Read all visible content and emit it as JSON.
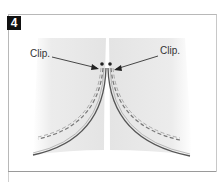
{
  "step": {
    "number": "4"
  },
  "labels": {
    "left": "Clip.",
    "right": "Clip."
  },
  "colors": {
    "fabric": "#e8e8e8",
    "stitch": "#777777",
    "edge": "#555555",
    "badge_bg": "#111111"
  },
  "icons": [
    "arrow-icon",
    "clip-marker-icon"
  ]
}
